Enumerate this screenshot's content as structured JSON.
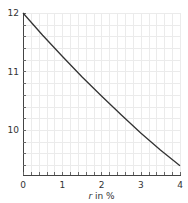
{
  "chart_data": {
    "type": "line",
    "title": "",
    "xlabel_var": "r",
    "xlabel_rest": " in %",
    "xlabel": "r in %",
    "ylabel": "",
    "xlim": [
      0,
      4
    ],
    "ylim": [
      9.23,
      12
    ],
    "grid": true,
    "legend": null,
    "x_ticks": [
      0,
      1,
      2,
      3,
      4
    ],
    "x_tick_labels": [
      "0",
      "1",
      "2",
      "3",
      "4"
    ],
    "y_ticks": [
      10,
      11,
      12
    ],
    "y_tick_labels": [
      "10",
      "11",
      "12"
    ],
    "x_minor_step": 0.2,
    "y_minor_step": 0.2,
    "series": [
      {
        "name": "curve",
        "color": "#333333",
        "x": [
          0,
          0.5,
          1,
          1.5,
          2,
          2.5,
          3,
          3.5,
          4
        ],
        "values": [
          12.0,
          11.62,
          11.26,
          10.91,
          10.58,
          10.26,
          9.95,
          9.66,
          9.39
        ]
      }
    ]
  },
  "colors": {
    "grid": "#ebebeb",
    "axis": "#444444",
    "line": "#333333"
  }
}
